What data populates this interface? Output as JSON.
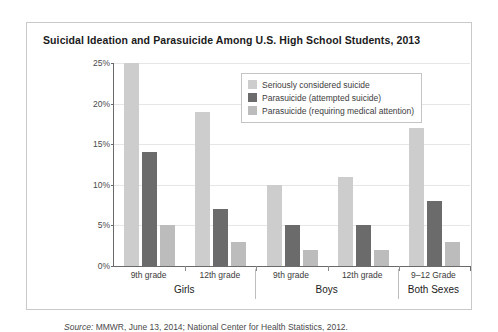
{
  "chart_data": {
    "type": "bar",
    "title": "Suicidal Ideation and Parasuicide Among U.S. High School Students, 2013",
    "xlabel": "",
    "ylabel": "",
    "ylim": [
      0,
      25
    ],
    "grid": true,
    "legend_position": "top-right inside plot",
    "ytick_labels": [
      "0%",
      "5%",
      "10%",
      "15%",
      "20%",
      "25%"
    ],
    "ytick_values": [
      0,
      5,
      10,
      15,
      20,
      25
    ],
    "categories": [
      "9th grade",
      "12th grade",
      "9th grade",
      "12th grade",
      "9–12 Grade"
    ],
    "supercategories": [
      "Girls",
      "Boys",
      "Both Sexes"
    ],
    "supercategory_spans": [
      2,
      2,
      1
    ],
    "series": [
      {
        "name": "Seriously considered suicide",
        "color": "#cdcdcd",
        "values": [
          25,
          19,
          10,
          11,
          17
        ]
      },
      {
        "name": "Parasuicide (attempted suicide)",
        "color": "#6b6b6b",
        "values": [
          14,
          7,
          5,
          5,
          8
        ]
      },
      {
        "name": "Parasuicide (requiring medical attention)",
        "color": "#bcbcbc",
        "values": [
          5,
          3,
          2,
          2,
          3
        ]
      }
    ],
    "source": "Source: MMWR, June 13, 2014; National Center for Health Statistics, 2012.",
    "source_prefix": "Source:",
    "source_rest": " MMWR, June 13, 2014; National Center for Health Statistics, 2012."
  }
}
